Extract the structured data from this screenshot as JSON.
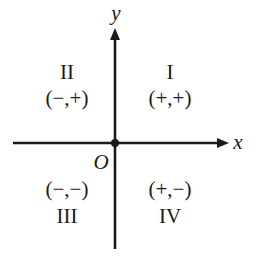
{
  "axes": {
    "x_label": "x",
    "y_label": "y",
    "origin_label": "O"
  },
  "quadrants": [
    {
      "numeral": "I",
      "signs": "(+,+)"
    },
    {
      "numeral": "II",
      "signs": "(−,+)"
    },
    {
      "numeral": "III",
      "signs": "(−,−)"
    },
    {
      "numeral": "IV",
      "signs": "(+,−)"
    }
  ],
  "colors": {
    "ink": "#1a1a1a",
    "background": "#ffffff"
  }
}
